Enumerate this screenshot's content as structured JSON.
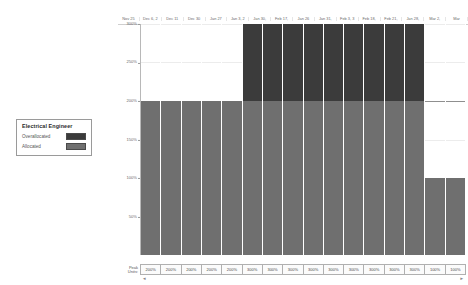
{
  "legend": {
    "title": "Electrical Engineer",
    "items": [
      {
        "label": "Overallocated",
        "color": "#3b3b3b"
      },
      {
        "label": "Allocated",
        "color": "#6f6f6f"
      }
    ]
  },
  "peak_units": {
    "row_label": "Peak Units:",
    "values": [
      "200%",
      "200%",
      "200%",
      "200%",
      "200%",
      "300%",
      "300%",
      "300%",
      "300%",
      "300%",
      "300%",
      "300%",
      "300%",
      "300%",
      "100%",
      "100%"
    ]
  },
  "scroll": {
    "left_mark": "◄",
    "right_mark": "►"
  },
  "chart_data": {
    "type": "bar",
    "title": "Electrical Engineer",
    "xlabel": "",
    "ylabel": "",
    "ylim": [
      0,
      300
    ],
    "grid": true,
    "legend_position": "left",
    "categories": [
      "Nov 25",
      "Dec 6, 2",
      "Dec 11",
      "Dec 30",
      "Jan 27",
      "Jan 3, 2",
      "Jan 30,",
      "Feb 17,",
      "Jan 26",
      "Jan 31,",
      "Feb 3, 3",
      "Feb 18,",
      "Feb 21,",
      "Jan 28,",
      "Mar 2,",
      "Mar"
    ],
    "tick_labels": [
      "300%",
      "250%",
      "200%",
      "150%",
      "100%",
      "50%"
    ],
    "tick_values": [
      300,
      250,
      200,
      150,
      100,
      50
    ],
    "series": [
      {
        "name": "Allocated",
        "color": "#6f6f6f",
        "values": [
          200,
          200,
          200,
          200,
          200,
          200,
          200,
          200,
          200,
          200,
          200,
          200,
          200,
          200,
          100,
          100
        ]
      },
      {
        "name": "Overallocated",
        "color": "#3b3b3b",
        "values": [
          0,
          0,
          0,
          0,
          0,
          100,
          100,
          100,
          100,
          100,
          100,
          100,
          100,
          100,
          0,
          0
        ]
      }
    ],
    "totals": [
      200,
      200,
      200,
      200,
      200,
      300,
      300,
      300,
      300,
      300,
      300,
      300,
      300,
      300,
      100,
      100
    ]
  }
}
